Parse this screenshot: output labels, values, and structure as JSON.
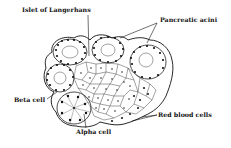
{
  "diagram": {
    "type": "labeled-biological-illustration",
    "labels": {
      "islet": "Islet of Langerhans",
      "acini": "Pancreatic acini",
      "beta": "Beta cell",
      "alpha": "Alpha cell",
      "rbc": "Red blood cells"
    },
    "colors": {
      "ink": "#111111",
      "background": "#ffffff"
    }
  }
}
